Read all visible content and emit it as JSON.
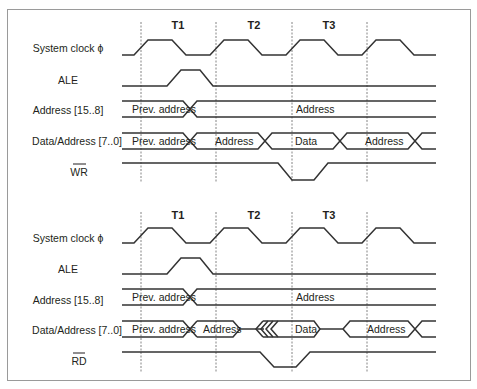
{
  "diagrams": [
    {
      "name": "write-cycle",
      "periods": [
        "T1",
        "T2",
        "T3"
      ],
      "signals": {
        "clock": "System clock ϕ",
        "ale": "ALE",
        "addr_hi": "Address [15..8]",
        "addr_lo": "Data/Address [7..0]",
        "strobe": "WR"
      },
      "bus_labels": {
        "addr_hi_prev": "Prev. address",
        "addr_hi_new": "Address",
        "addr_lo_prev": "Prev. address",
        "addr_lo_addr": "Address",
        "addr_lo_data": "Data",
        "addr_lo_next": "Address"
      }
    },
    {
      "name": "read-cycle",
      "periods": [
        "T1",
        "T2",
        "T3"
      ],
      "signals": {
        "clock": "System clock ϕ",
        "ale": "ALE",
        "addr_hi": "Address [15..8]",
        "addr_lo": "Data/Address [7..0]",
        "strobe": "RD"
      },
      "bus_labels": {
        "addr_hi_prev": "Prev. address",
        "addr_hi_new": "Address",
        "addr_lo_prev": "Prev. address",
        "addr_lo_addr": "Address",
        "addr_lo_data": "Data",
        "addr_lo_next": "Address"
      }
    }
  ],
  "colors": {
    "line": "#333333",
    "text": "#231f20",
    "border": "#9a9a9a"
  }
}
